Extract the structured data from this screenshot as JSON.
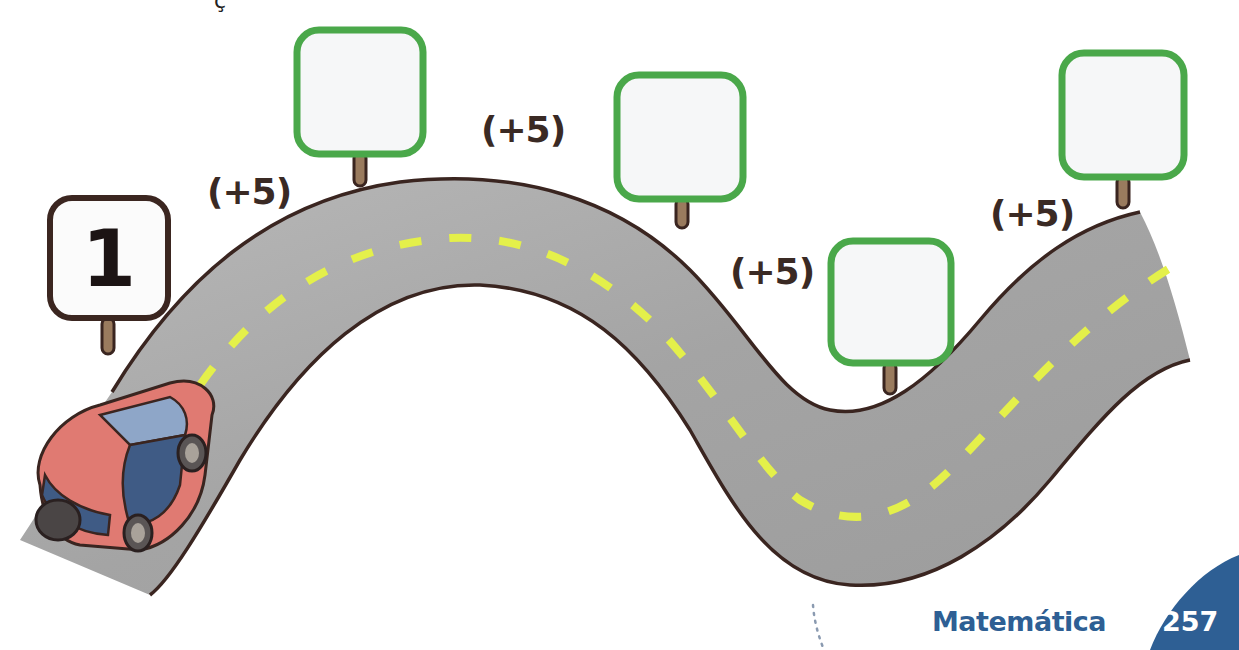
{
  "page": {
    "clipped_header_fragment": "ç",
    "footer": {
      "subject": "Matemática",
      "page_number": "257"
    }
  },
  "exercise": {
    "type": "counting-sequence",
    "rule": "(+5)",
    "step_labels": [
      "(+5)",
      "(+5)",
      "(+5)",
      "(+5)",
      "(+5)"
    ],
    "signs": [
      {
        "value": "1",
        "border_color": "#3b2620",
        "filled": true
      },
      {
        "value": "",
        "border_color": "#4aa84a",
        "filled": false
      },
      {
        "value": "",
        "border_color": "#4aa84a",
        "filled": false
      },
      {
        "value": "",
        "border_color": "#4aa84a",
        "filled": false
      },
      {
        "value": "",
        "border_color": "#4aa84a",
        "filled": false
      }
    ]
  },
  "colors": {
    "road": "#a9a9a9",
    "road_edge": "#3a2520",
    "lane_dash": "#e4f04a",
    "sign_green": "#4aa84a",
    "post": "#9a7b5e",
    "car_body": "#e07a72",
    "car_glass": "#3f5b85",
    "brand_blue": "#2e5f94"
  }
}
